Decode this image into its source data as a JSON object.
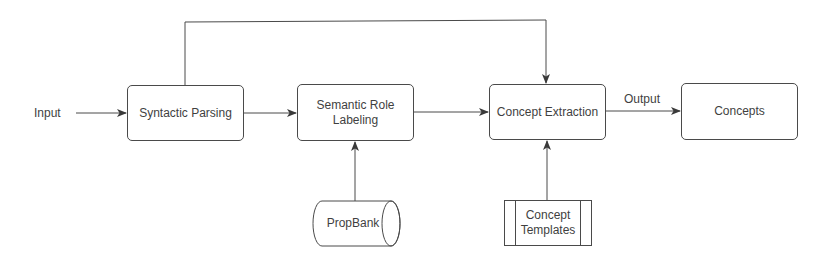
{
  "diagram": {
    "type": "flowchart",
    "input_label": "Input",
    "nodes": [
      {
        "id": "syntactic-parsing",
        "label": "Syntactic Parsing"
      },
      {
        "id": "semantic-role-labeling",
        "label": "Semantic Role Labeling"
      },
      {
        "id": "concept-extraction",
        "label": "Concept Extraction"
      },
      {
        "id": "concepts",
        "label": "Concepts"
      }
    ],
    "resources": [
      {
        "id": "propbank",
        "label": "PropBank",
        "shape": "cylinder"
      },
      {
        "id": "concept-templates",
        "label": "Concept Templates",
        "shape": "predefined-process"
      }
    ],
    "edge_labels": {
      "output": "Output"
    },
    "edges": [
      {
        "from": "input",
        "to": "syntactic-parsing"
      },
      {
        "from": "syntactic-parsing",
        "to": "semantic-role-labeling"
      },
      {
        "from": "syntactic-parsing",
        "to": "concept-extraction",
        "route": "top"
      },
      {
        "from": "semantic-role-labeling",
        "to": "concept-extraction"
      },
      {
        "from": "propbank",
        "to": "semantic-role-labeling"
      },
      {
        "from": "concept-templates",
        "to": "concept-extraction"
      },
      {
        "from": "concept-extraction",
        "to": "concepts",
        "label": "Output"
      }
    ],
    "colors": {
      "line": "#4a4a4a",
      "text": "#3f3f3f",
      "background": "#ffffff"
    }
  }
}
